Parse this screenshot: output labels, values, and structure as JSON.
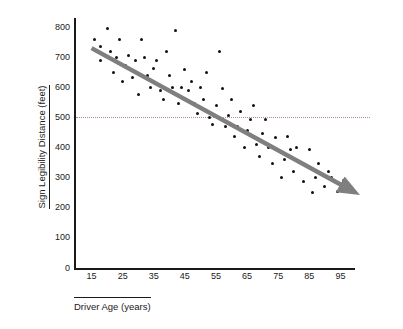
{
  "chart_data": {
    "type": "scatter",
    "title": "",
    "xlabel": "Driver Age (years)",
    "ylabel": "Sign Legibility Distance (feet)",
    "xlim": [
      10,
      100
    ],
    "ylim": [
      0,
      830
    ],
    "grid": false,
    "legend": null,
    "x_ticks": [
      15,
      25,
      35,
      45,
      55,
      65,
      75,
      85,
      95
    ],
    "y_ticks": [
      0,
      100,
      200,
      300,
      400,
      500,
      600,
      700,
      800
    ],
    "annotations": [
      {
        "type": "reference-line",
        "orientation": "horizontal",
        "value": 500,
        "style": "dotted",
        "color": "#b08aa0"
      },
      {
        "type": "trend-arrow",
        "color": "#7f7f7f",
        "from": [
          15,
          730
        ],
        "to": [
          99,
          255
        ]
      }
    ],
    "points": [
      {
        "x": 16,
        "y": 760
      },
      {
        "x": 18,
        "y": 735
      },
      {
        "x": 18,
        "y": 690
      },
      {
        "x": 20,
        "y": 795
      },
      {
        "x": 21,
        "y": 720
      },
      {
        "x": 22,
        "y": 648
      },
      {
        "x": 23,
        "y": 700
      },
      {
        "x": 24,
        "y": 760
      },
      {
        "x": 25,
        "y": 620
      },
      {
        "x": 26,
        "y": 672
      },
      {
        "x": 27,
        "y": 705
      },
      {
        "x": 28,
        "y": 632
      },
      {
        "x": 29,
        "y": 690
      },
      {
        "x": 30,
        "y": 576
      },
      {
        "x": 31,
        "y": 760
      },
      {
        "x": 32,
        "y": 700
      },
      {
        "x": 33,
        "y": 640
      },
      {
        "x": 34,
        "y": 600
      },
      {
        "x": 35,
        "y": 662
      },
      {
        "x": 36,
        "y": 690
      },
      {
        "x": 37,
        "y": 590
      },
      {
        "x": 38,
        "y": 560
      },
      {
        "x": 39,
        "y": 720
      },
      {
        "x": 40,
        "y": 640
      },
      {
        "x": 41,
        "y": 600
      },
      {
        "x": 42,
        "y": 790
      },
      {
        "x": 43,
        "y": 545
      },
      {
        "x": 44,
        "y": 600
      },
      {
        "x": 45,
        "y": 660
      },
      {
        "x": 46,
        "y": 588
      },
      {
        "x": 47,
        "y": 620
      },
      {
        "x": 48,
        "y": 545
      },
      {
        "x": 49,
        "y": 512
      },
      {
        "x": 50,
        "y": 600
      },
      {
        "x": 51,
        "y": 560
      },
      {
        "x": 52,
        "y": 650
      },
      {
        "x": 53,
        "y": 500
      },
      {
        "x": 54,
        "y": 475
      },
      {
        "x": 55,
        "y": 540
      },
      {
        "x": 56,
        "y": 720
      },
      {
        "x": 57,
        "y": 596
      },
      {
        "x": 58,
        "y": 470
      },
      {
        "x": 59,
        "y": 505
      },
      {
        "x": 60,
        "y": 560
      },
      {
        "x": 61,
        "y": 436
      },
      {
        "x": 62,
        "y": 470
      },
      {
        "x": 63,
        "y": 520
      },
      {
        "x": 64,
        "y": 400
      },
      {
        "x": 65,
        "y": 455
      },
      {
        "x": 66,
        "y": 492
      },
      {
        "x": 67,
        "y": 540
      },
      {
        "x": 68,
        "y": 410
      },
      {
        "x": 69,
        "y": 370
      },
      {
        "x": 70,
        "y": 448
      },
      {
        "x": 71,
        "y": 492
      },
      {
        "x": 72,
        "y": 400
      },
      {
        "x": 73,
        "y": 348
      },
      {
        "x": 74,
        "y": 432
      },
      {
        "x": 75,
        "y": 390
      },
      {
        "x": 76,
        "y": 300
      },
      {
        "x": 77,
        "y": 360
      },
      {
        "x": 78,
        "y": 436
      },
      {
        "x": 79,
        "y": 392
      },
      {
        "x": 80,
        "y": 320
      },
      {
        "x": 81,
        "y": 400
      },
      {
        "x": 82,
        "y": 350
      },
      {
        "x": 83,
        "y": 288
      },
      {
        "x": 84,
        "y": 340
      },
      {
        "x": 85,
        "y": 392
      },
      {
        "x": 86,
        "y": 250
      },
      {
        "x": 87,
        "y": 300
      },
      {
        "x": 88,
        "y": 348
      },
      {
        "x": 90,
        "y": 270
      },
      {
        "x": 91,
        "y": 320
      },
      {
        "x": 92,
        "y": 300
      },
      {
        "x": 94,
        "y": 255
      },
      {
        "x": 96,
        "y": 290
      },
      {
        "x": 98,
        "y": 262
      }
    ]
  }
}
